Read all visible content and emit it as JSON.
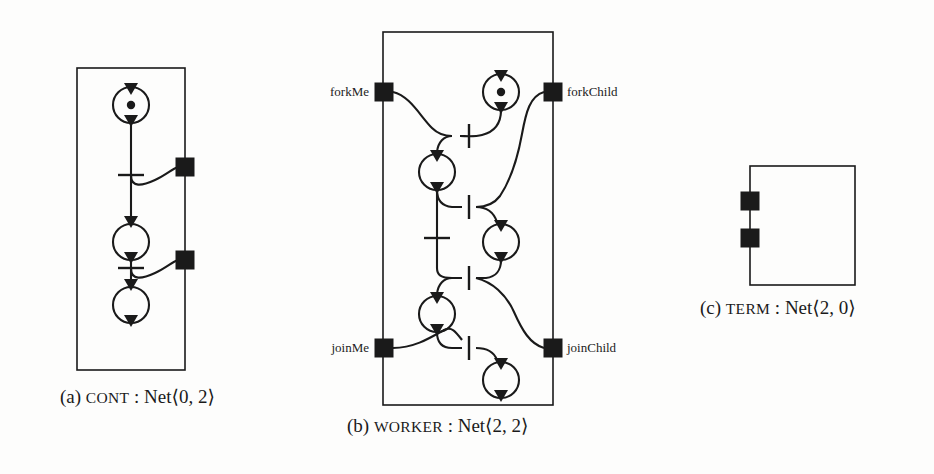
{
  "figure": {
    "background_color": "#fdfdfc",
    "ink_color": "#1a1a1a",
    "panels": [
      {
        "id": "a",
        "tag": "(a)",
        "name": "CONT",
        "separator": ":",
        "type": "Net",
        "signature": "⟨0, 2⟩",
        "inputs": 0,
        "outputs": 2,
        "caption_full": "(a) CONT : Net⟨0, 2⟩",
        "places": 3,
        "transitions": 2,
        "ports": 2,
        "tokens": 1,
        "port_labels": []
      },
      {
        "id": "b",
        "tag": "(b)",
        "name": "WORKER",
        "separator": ":",
        "type": "Net",
        "signature": "⟨2, 2⟩",
        "inputs": 2,
        "outputs": 2,
        "caption_full": "(b) WORKER : Net⟨2, 2⟩",
        "places": 6,
        "transitions": 5,
        "ports": 4,
        "tokens": 1,
        "port_labels": [
          {
            "text": "forkMe",
            "side": "left",
            "y": 92
          },
          {
            "text": "forkChild",
            "side": "right",
            "y": 92
          },
          {
            "text": "joinMe",
            "side": "left",
            "y": 348
          },
          {
            "text": "joinChild",
            "side": "right",
            "y": 348
          }
        ]
      },
      {
        "id": "c",
        "tag": "(c)",
        "name": "TERM",
        "separator": ":",
        "type": "Net",
        "signature": "⟨2, 0⟩",
        "inputs": 2,
        "outputs": 0,
        "caption_full": "(c) TERM : Net⟨2, 0⟩",
        "places": 0,
        "transitions": 0,
        "ports": 2,
        "tokens": 0,
        "port_labels": []
      }
    ],
    "captions": {
      "a": {
        "tag": "(a)",
        "name": "CONT",
        "sep": " : ",
        "type": "Net",
        "sig": "⟨0, 2⟩"
      },
      "b": {
        "tag": "(b)",
        "name": "WORKER",
        "sep": " : ",
        "type": "Net",
        "sig": "⟨2, 2⟩"
      },
      "c": {
        "tag": "(c)",
        "name": "TERM",
        "sep": " : ",
        "type": "Net",
        "sig": "⟨2, 0⟩"
      }
    },
    "labels": {
      "forkMe": "forkMe",
      "forkChild": "forkChild",
      "joinMe": "joinMe",
      "joinChild": "joinChild"
    }
  }
}
